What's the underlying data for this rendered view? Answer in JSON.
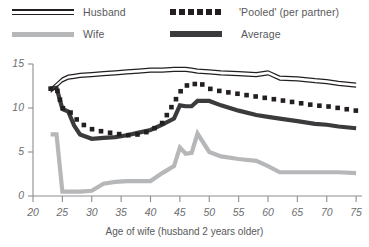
{
  "legend": {
    "items": [
      {
        "label": "Husband",
        "icon": "double-line-swatch",
        "color": "#231f20"
      },
      {
        "label": "'Pooled' (per partner)",
        "icon": "dotted-line-swatch",
        "color": "#231f20"
      },
      {
        "label": "Wife",
        "icon": "thick-line-swatch",
        "color": "#b6b7b9"
      },
      {
        "label": "Average",
        "icon": "thick-line-swatch",
        "color": "#3b3b3d"
      }
    ]
  },
  "axes": {
    "x_title": "Age of wife (husband 2 years older)",
    "y_ticks": [
      "0",
      "5",
      "10",
      "15"
    ],
    "x_ticks": [
      "20",
      "25",
      "30",
      "35",
      "40",
      "45",
      "50",
      "55",
      "60",
      "65",
      "70",
      "75"
    ]
  },
  "chart_data": {
    "type": "line",
    "title": "",
    "xlabel": "Age of wife (husband 2 years older)",
    "ylabel": "",
    "xlim": [
      20,
      76
    ],
    "ylim": [
      0,
      15
    ],
    "grid": false,
    "legend_position": "top",
    "x": [
      23,
      24,
      25,
      26,
      27,
      28,
      30,
      32,
      34,
      36,
      38,
      40,
      42,
      44,
      45,
      46,
      47,
      48,
      50,
      52,
      55,
      58,
      60,
      62,
      65,
      68,
      70,
      72,
      75
    ],
    "series": [
      {
        "name": "Husband",
        "style": "double-line",
        "color": "#231f20",
        "values": [
          12.0,
          12.6,
          13.2,
          13.5,
          13.6,
          13.7,
          13.8,
          13.9,
          14.0,
          14.1,
          14.2,
          14.3,
          14.3,
          14.4,
          14.4,
          14.4,
          14.3,
          14.2,
          14.1,
          14.0,
          13.9,
          13.8,
          14.0,
          13.4,
          13.3,
          13.1,
          13.0,
          12.8,
          12.6
        ]
      },
      {
        "name": "'Pooled' (per partner)",
        "style": "dotted",
        "color": "#231f20",
        "values": [
          12.2,
          12.3,
          10.0,
          9.8,
          9.0,
          8.3,
          7.6,
          7.3,
          7.1,
          6.9,
          7.0,
          7.4,
          8.3,
          10.6,
          11.8,
          12.6,
          12.4,
          13.0,
          12.2,
          11.9,
          11.6,
          11.3,
          11.1,
          10.9,
          10.6,
          10.3,
          10.2,
          10.0,
          9.7
        ]
      },
      {
        "name": "Average",
        "style": "thick",
        "color": "#3b3b3d",
        "values": [
          12.2,
          12.3,
          9.9,
          9.6,
          8.0,
          7.0,
          6.5,
          6.6,
          6.7,
          6.9,
          7.2,
          7.5,
          8.1,
          8.8,
          10.3,
          10.2,
          10.2,
          10.8,
          10.8,
          10.3,
          9.7,
          9.2,
          9.0,
          8.8,
          8.5,
          8.2,
          8.1,
          7.9,
          7.7
        ]
      },
      {
        "name": "Wife",
        "style": "thick",
        "color": "#b6b7b9",
        "values": [
          7.0,
          7.0,
          0.5,
          0.5,
          0.5,
          0.5,
          0.6,
          1.4,
          1.6,
          1.7,
          1.7,
          1.7,
          2.6,
          3.4,
          5.5,
          4.8,
          4.9,
          7.1,
          5.0,
          4.5,
          4.2,
          4.0,
          3.4,
          2.7,
          2.7,
          2.7,
          2.7,
          2.7,
          2.6
        ]
      }
    ]
  }
}
